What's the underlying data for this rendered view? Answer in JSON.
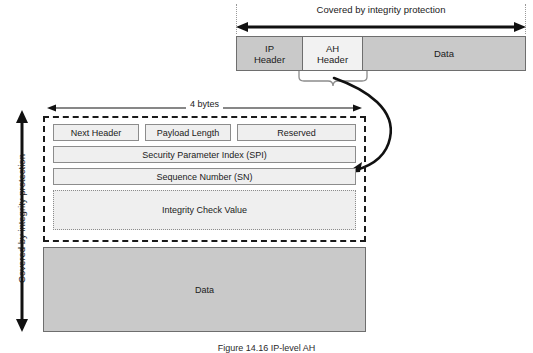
{
  "figure": {
    "caption": "Figure 14.16  IP-level AH",
    "top_label": "Covered by integrity protection",
    "left_label": "Covered by integrity protection",
    "width_label": "4 bytes"
  },
  "top_packet": {
    "segments": [
      {
        "name": "ip-header",
        "label": "IP\nHeader",
        "line1": "IP",
        "line2": "Header",
        "color": "#c9c9c9"
      },
      {
        "name": "ah-header",
        "label": "AH\nHeader",
        "line1": "AH",
        "line2": "Header",
        "color": "#f2f2f2"
      },
      {
        "name": "data",
        "label": "Data",
        "line1": "Data",
        "line2": "",
        "color": "#c9c9c9"
      }
    ]
  },
  "ah_header": {
    "row1": [
      {
        "label": "Next Header"
      },
      {
        "label": "Payload Length"
      },
      {
        "label": "Reserved"
      }
    ],
    "row2": {
      "label": "Security Parameter Index (SPI)"
    },
    "row3": {
      "label": "Sequence Number (SN)"
    },
    "icv": {
      "label": "Integrity Check Value"
    }
  },
  "payload": {
    "label": "Data"
  },
  "colors": {
    "gray_block": "#c9c9c9",
    "light_block": "#f2f2f2",
    "field_fill": "#efefef",
    "line": "#1a1a1a",
    "border": "#8c8c8c"
  }
}
